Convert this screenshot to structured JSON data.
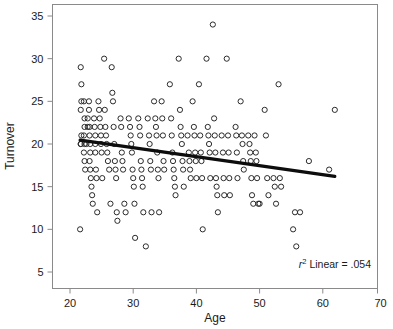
{
  "chart_data": {
    "type": "scatter",
    "title": "",
    "xlabel": "Age",
    "ylabel": "Turnover",
    "xlim": [
      17,
      72
    ],
    "ylim": [
      3,
      36.5
    ],
    "xticks": [
      20,
      30,
      40,
      50,
      60,
      70
    ],
    "yticks": [
      5,
      10,
      15,
      20,
      25,
      30,
      35
    ],
    "grid": false,
    "legend": false,
    "marker": "open-circle",
    "annotation": {
      "prefix_italic": "r",
      "superscript": "2",
      "text": " Linear = .054",
      "full": "r2 Linear = .054",
      "r_squared": 0.054
    },
    "fit_line": {
      "type": "linear",
      "x_start": 21.6,
      "y_start": 20.45,
      "x_end": 61.9,
      "y_end": 16.2,
      "slope": -0.105,
      "intercept": 22.72,
      "color": "#0d0d0d"
    },
    "points": [
      [
        21.7,
        29
      ],
      [
        21.8,
        27
      ],
      [
        21.8,
        25
      ],
      [
        21.7,
        24
      ],
      [
        21.8,
        21
      ],
      [
        21.7,
        20
      ],
      [
        21.7,
        20
      ],
      [
        21.6,
        10
      ],
      [
        22.2,
        25
      ],
      [
        22.3,
        23
      ],
      [
        22.3,
        22
      ],
      [
        22.2,
        21
      ],
      [
        22.3,
        20
      ],
      [
        22.2,
        19
      ],
      [
        22.3,
        18
      ],
      [
        22.4,
        17
      ],
      [
        22.6,
        20
      ],
      [
        22.8,
        22
      ],
      [
        22.8,
        23
      ],
      [
        23.0,
        25
      ],
      [
        23.0,
        24
      ],
      [
        23.1,
        22
      ],
      [
        23.1,
        21
      ],
      [
        23.2,
        20
      ],
      [
        23.2,
        19
      ],
      [
        23.1,
        18
      ],
      [
        23.2,
        17
      ],
      [
        23.3,
        16
      ],
      [
        23.4,
        15
      ],
      [
        23.5,
        14
      ],
      [
        23.6,
        13
      ],
      [
        23.8,
        23
      ],
      [
        23.9,
        22
      ],
      [
        24.0,
        21
      ],
      [
        24.0,
        20
      ],
      [
        24.0,
        19
      ],
      [
        24.1,
        17
      ],
      [
        24.2,
        16
      ],
      [
        24.3,
        12
      ],
      [
        24.5,
        25
      ],
      [
        24.6,
        24
      ],
      [
        24.7,
        23
      ],
      [
        24.8,
        22
      ],
      [
        24.9,
        21
      ],
      [
        24.9,
        20
      ],
      [
        25.0,
        19
      ],
      [
        25.1,
        16
      ],
      [
        25.4,
        30
      ],
      [
        25.5,
        24
      ],
      [
        25.6,
        22
      ],
      [
        25.7,
        21
      ],
      [
        25.8,
        20
      ],
      [
        25.9,
        19
      ],
      [
        26.0,
        18
      ],
      [
        26.2,
        17
      ],
      [
        26.4,
        13
      ],
      [
        26.6,
        29
      ],
      [
        26.7,
        26
      ],
      [
        26.8,
        25
      ],
      [
        26.9,
        22
      ],
      [
        27.0,
        20
      ],
      [
        27.1,
        18
      ],
      [
        27.2,
        17
      ],
      [
        27.3,
        16
      ],
      [
        27.4,
        12
      ],
      [
        27.5,
        11
      ],
      [
        28.0,
        23
      ],
      [
        28.1,
        22
      ],
      [
        28.2,
        19
      ],
      [
        28.3,
        18
      ],
      [
        28.4,
        17
      ],
      [
        28.6,
        13
      ],
      [
        28.8,
        12
      ],
      [
        29.3,
        23
      ],
      [
        29.5,
        22
      ],
      [
        29.6,
        21
      ],
      [
        29.7,
        20
      ],
      [
        29.8,
        19
      ],
      [
        29.9,
        17
      ],
      [
        30.0,
        16
      ],
      [
        30.1,
        15
      ],
      [
        30.2,
        13
      ],
      [
        30.3,
        9
      ],
      [
        30.8,
        23
      ],
      [
        31.0,
        22
      ],
      [
        31.1,
        21
      ],
      [
        31.2,
        18
      ],
      [
        31.3,
        17
      ],
      [
        31.4,
        16
      ],
      [
        31.5,
        15
      ],
      [
        31.6,
        12
      ],
      [
        32.0,
        8
      ],
      [
        32.3,
        23
      ],
      [
        32.5,
        21
      ],
      [
        32.6,
        20
      ],
      [
        32.7,
        18
      ],
      [
        32.8,
        17
      ],
      [
        32.9,
        12
      ],
      [
        33.3,
        25
      ],
      [
        33.5,
        23
      ],
      [
        33.6,
        22
      ],
      [
        33.7,
        21
      ],
      [
        33.8,
        19
      ],
      [
        33.9,
        17
      ],
      [
        34.0,
        16
      ],
      [
        34.1,
        12
      ],
      [
        34.5,
        25
      ],
      [
        34.6,
        23
      ],
      [
        34.7,
        21
      ],
      [
        34.8,
        18
      ],
      [
        34.9,
        17
      ],
      [
        35.8,
        27
      ],
      [
        36.0,
        23
      ],
      [
        36.1,
        21
      ],
      [
        36.2,
        19
      ],
      [
        36.3,
        18
      ],
      [
        36.4,
        17
      ],
      [
        36.5,
        16
      ],
      [
        36.6,
        15
      ],
      [
        36.7,
        14
      ],
      [
        37.2,
        30
      ],
      [
        37.4,
        24
      ],
      [
        37.5,
        22
      ],
      [
        37.6,
        21
      ],
      [
        37.7,
        20
      ],
      [
        37.8,
        18
      ],
      [
        37.9,
        17
      ],
      [
        38.0,
        15
      ],
      [
        38.6,
        21
      ],
      [
        38.8,
        19
      ],
      [
        38.9,
        18
      ],
      [
        39.0,
        17
      ],
      [
        39.1,
        16
      ],
      [
        39.4,
        25
      ],
      [
        39.6,
        22
      ],
      [
        39.7,
        21
      ],
      [
        39.8,
        19
      ],
      [
        39.9,
        18
      ],
      [
        40.0,
        16
      ],
      [
        40.4,
        27
      ],
      [
        40.6,
        21
      ],
      [
        40.7,
        19
      ],
      [
        40.8,
        18
      ],
      [
        40.9,
        16
      ],
      [
        41.0,
        10
      ],
      [
        41.6,
        30
      ],
      [
        41.8,
        22
      ],
      [
        41.9,
        21
      ],
      [
        42.0,
        20
      ],
      [
        42.1,
        19
      ],
      [
        42.2,
        16
      ],
      [
        42.6,
        34
      ],
      [
        42.8,
        23
      ],
      [
        42.9,
        21
      ],
      [
        43.0,
        19
      ],
      [
        43.1,
        16
      ],
      [
        43.2,
        15
      ],
      [
        43.3,
        14
      ],
      [
        43.4,
        12
      ],
      [
        44.0,
        21
      ],
      [
        44.2,
        19
      ],
      [
        44.3,
        16
      ],
      [
        44.4,
        14
      ],
      [
        44.8,
        30
      ],
      [
        45.0,
        21
      ],
      [
        45.1,
        19
      ],
      [
        45.2,
        16
      ],
      [
        45.3,
        14
      ],
      [
        46.2,
        22
      ],
      [
        46.3,
        21
      ],
      [
        46.4,
        19
      ],
      [
        46.5,
        16
      ],
      [
        47.0,
        25
      ],
      [
        47.2,
        21
      ],
      [
        47.3,
        20
      ],
      [
        47.4,
        18
      ],
      [
        47.5,
        17
      ],
      [
        48.2,
        21
      ],
      [
        48.4,
        20
      ],
      [
        48.5,
        19
      ],
      [
        48.6,
        18
      ],
      [
        48.7,
        16
      ],
      [
        48.8,
        14
      ],
      [
        49.0,
        13
      ],
      [
        49.2,
        21
      ],
      [
        49.4,
        19
      ],
      [
        49.5,
        18
      ],
      [
        49.6,
        16
      ],
      [
        49.8,
        13
      ],
      [
        50.0,
        13
      ],
      [
        50.8,
        24
      ],
      [
        51.0,
        21
      ],
      [
        51.2,
        16
      ],
      [
        51.4,
        14
      ],
      [
        52.2,
        16
      ],
      [
        52.4,
        15
      ],
      [
        52.6,
        13
      ],
      [
        53.0,
        27
      ],
      [
        53.2,
        16
      ],
      [
        53.4,
        15
      ],
      [
        55.3,
        10
      ],
      [
        55.6,
        12
      ],
      [
        55.8,
        8
      ],
      [
        56.4,
        12
      ],
      [
        57.8,
        18
      ],
      [
        61.0,
        17
      ],
      [
        61.9,
        24
      ]
    ]
  },
  "axes": {
    "x": {
      "title": "Age",
      "tick_labels": [
        "20",
        "30",
        "40",
        "50",
        "60",
        "70"
      ]
    },
    "y": {
      "title": "Turnover",
      "tick_labels": [
        "5",
        "10",
        "15",
        "20",
        "25",
        "30",
        "35"
      ]
    }
  }
}
